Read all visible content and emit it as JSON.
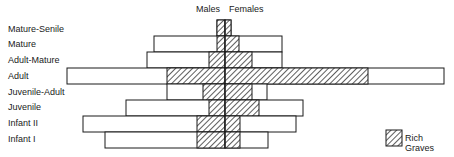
{
  "chart_data": {
    "type": "bar",
    "subtype": "population-pyramid",
    "title": "",
    "header_left": "Males",
    "header_right": "Females",
    "units": "relative (pixels from center axis, no numeric scale shown)",
    "categories": [
      "Mature-Senile",
      "Mature",
      "Adult-Mature",
      "Adult",
      "Juvenile-Adult",
      "Juvenile",
      "Infant II",
      "Infant I"
    ],
    "series": [
      {
        "name": "Males (total)",
        "values": [
          8,
          71,
          78,
          158,
          58,
          99,
          142,
          120
        ]
      },
      {
        "name": "Females (total)",
        "values": [
          6,
          57,
          57,
          219,
          42,
          78,
          71,
          43
        ]
      },
      {
        "name": "Males (Rich Graves)",
        "values": [
          8,
          8,
          16,
          58,
          22,
          16,
          28,
          28
        ]
      },
      {
        "name": "Females (Rich Graves)",
        "values": [
          6,
          14,
          27,
          143,
          27,
          34,
          15,
          15
        ]
      }
    ],
    "legend": [
      {
        "label": "Rich Graves",
        "pattern": "diagonal-hatch"
      }
    ],
    "legend_position": "bottom-right",
    "grid": false,
    "colors": {
      "line": "#1a1a1a",
      "background": "#ffffff",
      "fill": "#ffffff"
    }
  },
  "layout": {
    "center_x": 225,
    "row_top": 20,
    "row_height": 16,
    "label_y": [
      26,
      41,
      57,
      73,
      89,
      104,
      120,
      136
    ]
  }
}
